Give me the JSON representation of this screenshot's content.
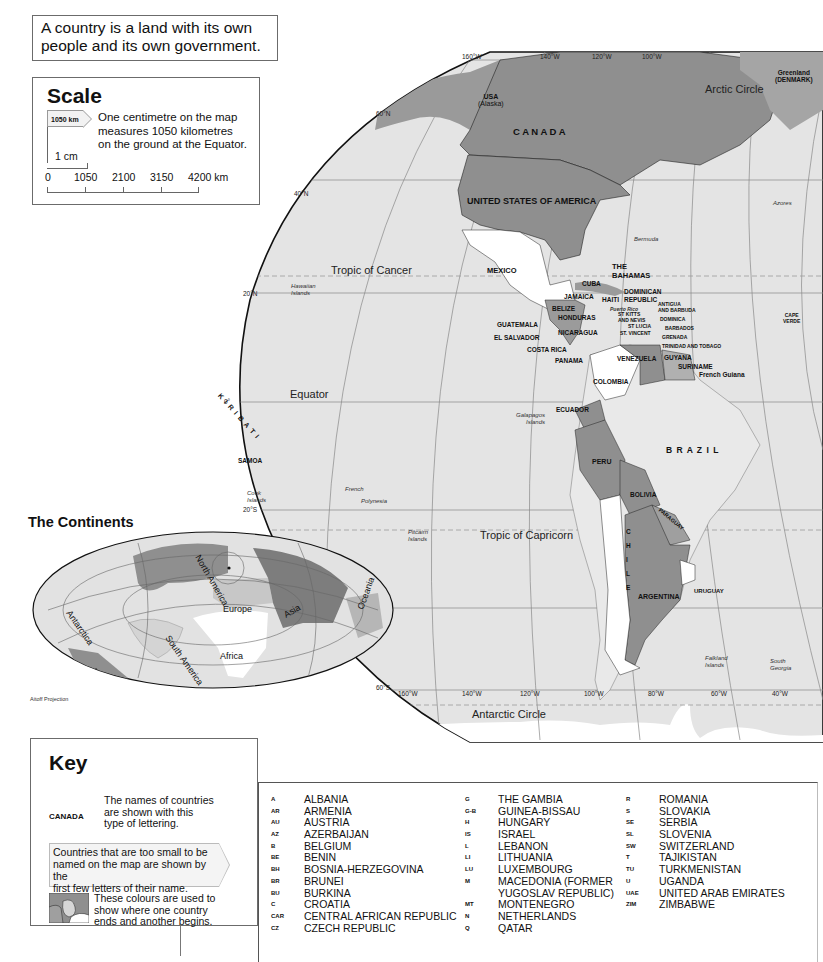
{
  "intro": {
    "line1": "A country is a land with its own",
    "line2": "people and its own government."
  },
  "scale": {
    "title": "Scale",
    "tag": "1050 km",
    "description": [
      "One centimetre on the map",
      "measures 1050 kilometres",
      "on the ground at the Equator."
    ],
    "cm_label": "1 cm",
    "ticks": [
      "0",
      "1050",
      "2100",
      "3150",
      "4200 km"
    ]
  },
  "map": {
    "longitude_labels_top": [
      "160°W",
      "140°W",
      "120°W",
      "100°W"
    ],
    "longitude_labels_bottom": [
      "160°W",
      "140°W",
      "120°W",
      "100°W",
      "80°W",
      "60°W",
      "40°W"
    ],
    "latitude_labels": [
      "60°N",
      "40°N",
      "20°N",
      "0°",
      "20°S",
      "40°S",
      "60°S"
    ],
    "lines": {
      "arctic": "Arctic Circle",
      "cancer": "Tropic of Cancer",
      "equator": "Equator",
      "capricorn": "Tropic of Capricorn",
      "antarctic": "Antarctic Circle"
    },
    "countries": {
      "usa_alaska": [
        "USA",
        "(Alaska)"
      ],
      "canada": "C A N A D A",
      "usa": "UNITED STATES OF AMERICA",
      "greenland": [
        "Greenland",
        "(DENMARK)"
      ],
      "mexico": "MEXICO",
      "bahamas": [
        "THE",
        "BAHAMAS"
      ],
      "cuba": "CUBA",
      "jamaica": "JAMAICA",
      "haiti": "HAITI",
      "dominican": [
        "DOMINICAN",
        "REPUBLIC"
      ],
      "puerto_rico": "Puerto Rico",
      "st_kitts": [
        "ST KITTS",
        "AND NEVIS"
      ],
      "antigua": [
        "ANTIGUA",
        "AND BARBUDA"
      ],
      "dominica": "DOMINICA",
      "st_lucia": "ST LUCIA",
      "st_vincent": "ST. VINCENT",
      "barbados": "BARBADOS",
      "grenada": "GRENADA",
      "trinidad": "TRINIDAD AND TOBAGO",
      "belize": "BELIZE",
      "honduras": "HONDURAS",
      "guatemala": "GUATEMALA",
      "el_salvador": "EL SALVADOR",
      "nicaragua": "NICARAGUA",
      "costa_rica": "COSTA RICA",
      "panama": "PANAMA",
      "venezuela": "VENEZUELA",
      "guyana": "GUYANA",
      "suriname": "SURINAME",
      "french_guiana": "French Guiana",
      "colombia": "COLOMBIA",
      "ecuador": "ECUADOR",
      "brazil": "B R A Z I L",
      "peru": "PERU",
      "bolivia": "BOLIVIA",
      "paraguay": "PARAGUAY",
      "chile": [
        "C",
        "H",
        "I",
        "L",
        "E"
      ],
      "argentina": "ARGENTINA",
      "uruguay": "URUGUAY",
      "cape_verde": [
        "CAPE",
        "VERDE"
      ],
      "kiribati": "K I R I B A T I",
      "samoa": "SAMOA"
    },
    "places": {
      "hawaii": [
        "Hawaiian",
        "Islands"
      ],
      "bermuda": "Bermuda",
      "azores": "Azores",
      "galapagos": [
        "Galapagos",
        "Islands"
      ],
      "cook": [
        "Cook",
        "Islands"
      ],
      "french_polynesia": [
        "French",
        "Polynesia"
      ],
      "pitcairn": [
        "Pitcairn",
        "Islands"
      ],
      "falkland": [
        "Falkland",
        "Islands"
      ],
      "south_georgia": [
        "South",
        "Georgia"
      ]
    }
  },
  "continents": {
    "title": "The Continents",
    "labels": [
      "North America",
      "South America",
      "Europe",
      "Asia",
      "Africa",
      "Oceania",
      "Antarctica"
    ],
    "projection": "Aitoff Projection"
  },
  "key": {
    "title": "Key",
    "sample": "CANADA",
    "text1": [
      "The names of countries",
      "are shown with this",
      "type of lettering."
    ],
    "text2": [
      "Countries that are too small to be",
      "named on the map are shown by the",
      "first few letters of their name."
    ],
    "text3": [
      "These colours are used to",
      "show where one country",
      "ends and another begins."
    ]
  },
  "abbreviations": {
    "col1": [
      {
        "code": "A",
        "name": "ALBANIA"
      },
      {
        "code": "AR",
        "name": "ARMENIA"
      },
      {
        "code": "AU",
        "name": "AUSTRIA"
      },
      {
        "code": "AZ",
        "name": "AZERBAIJAN"
      },
      {
        "code": "B",
        "name": "BELGIUM"
      },
      {
        "code": "BE",
        "name": "BENIN"
      },
      {
        "code": "BH",
        "name": "BOSNIA-HERZEGOVINA"
      },
      {
        "code": "BR",
        "name": "BRUNEI"
      },
      {
        "code": "BU",
        "name": "BURKINA"
      },
      {
        "code": "C",
        "name": "CROATIA"
      },
      {
        "code": "CAR",
        "name": "CENTRAL AFRICAN REPUBLIC"
      },
      {
        "code": "CZ",
        "name": "CZECH REPUBLIC"
      }
    ],
    "col2": [
      {
        "code": "G",
        "name": "THE GAMBIA"
      },
      {
        "code": "G-B",
        "name": "GUINEA-BISSAU"
      },
      {
        "code": "H",
        "name": "HUNGARY"
      },
      {
        "code": "IS",
        "name": "ISRAEL"
      },
      {
        "code": "L",
        "name": "LEBANON"
      },
      {
        "code": "LI",
        "name": "LITHUANIA"
      },
      {
        "code": "LU",
        "name": "LUXEMBOURG"
      },
      {
        "code": "M",
        "name": "MACEDONIA (FORMER"
      },
      {
        "code": "",
        "name": "YUGOSLAV REPUBLIC)"
      },
      {
        "code": "MT",
        "name": "MONTENEGRO"
      },
      {
        "code": "N",
        "name": "NETHERLANDS"
      },
      {
        "code": "Q",
        "name": "QATAR"
      }
    ],
    "col3": [
      {
        "code": "R",
        "name": "ROMANIA"
      },
      {
        "code": "S",
        "name": "SLOVAKIA"
      },
      {
        "code": "SE",
        "name": "SERBIA"
      },
      {
        "code": "SL",
        "name": "SLOVENIA"
      },
      {
        "code": "SW",
        "name": "SWITZERLAND"
      },
      {
        "code": "T",
        "name": "TAJIKISTAN"
      },
      {
        "code": "TU",
        "name": "TURKMENISTAN"
      },
      {
        "code": "U",
        "name": "UGANDA"
      },
      {
        "code": "UAE",
        "name": "UNITED ARAB EMIRATES"
      },
      {
        "code": "ZIM",
        "name": "ZIMBABWE"
      }
    ]
  },
  "colors": {
    "ocean": "#e4e4e4",
    "land_dark": "#8c8c8c",
    "land_mid": "#b3b3b3",
    "land_white": "#ffffff",
    "border": "#222222"
  }
}
